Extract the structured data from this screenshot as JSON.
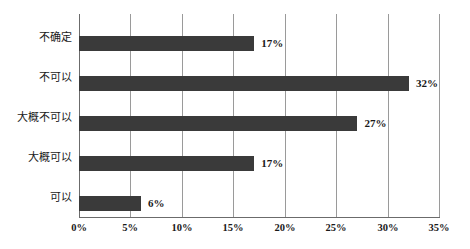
{
  "chart_data": {
    "type": "bar",
    "orientation": "horizontal",
    "title": "",
    "subtitle": "",
    "xlabel": "",
    "ylabel": "",
    "categories": [
      "不确定",
      "不可以",
      "大概不可以",
      "大概可以",
      "可以"
    ],
    "values": [
      17,
      32,
      27,
      17,
      6
    ],
    "value_labels": [
      "17%",
      "32%",
      "27%",
      "17%",
      "6%"
    ],
    "xlim": [
      0,
      35
    ],
    "xticks": [
      0,
      5,
      10,
      15,
      20,
      25,
      30,
      35
    ],
    "xtick_labels": [
      "0%",
      "5%",
      "10%",
      "15%",
      "20%",
      "25%",
      "30%",
      "35%"
    ],
    "grid": "vertical",
    "legend": "none",
    "colors": {
      "bar": "#3a3a3a",
      "gridline": "#9a9a9a",
      "axis": "#6b6b6b",
      "text": "#1a1a1a",
      "background": "#ffffff"
    }
  }
}
